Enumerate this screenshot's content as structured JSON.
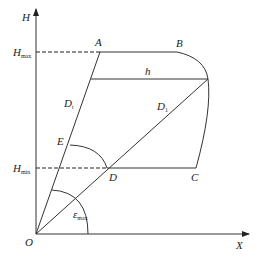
{
  "diagram": {
    "axes": {
      "y_label": "H",
      "x_label": "X",
      "origin_label": "O"
    },
    "levels": {
      "h_max": {
        "label": "H",
        "sub": "max"
      },
      "h_min": {
        "label": "H",
        "sub": "min"
      }
    },
    "points": {
      "A": "A",
      "B": "B",
      "C": "C",
      "D": "D",
      "E": "E"
    },
    "segments": {
      "h": "h",
      "D_t": {
        "label": "D",
        "sub": "t"
      },
      "D_1": {
        "label": "D",
        "sub": "1"
      }
    },
    "angle": {
      "label": "ε",
      "sub": "max"
    },
    "colors": {
      "line": "#333333",
      "background": "#ffffff"
    }
  }
}
